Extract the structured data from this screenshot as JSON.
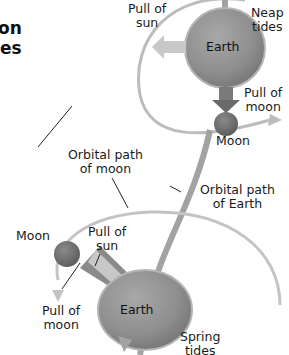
{
  "title": {
    "line1": "on",
    "line2": "es"
  },
  "neap": {
    "heading": "Neap\ntides",
    "pull_of_sun": "Pull of\nsun",
    "earth": "Earth",
    "pull_of_moon": "Pull of\nmoon",
    "moon": "Moon"
  },
  "labels": {
    "orbital_path_moon": "Orbital path\nof moon",
    "orbital_path_earth": "Orbital path\nof Earth"
  },
  "spring": {
    "heading": "Spring\ntides",
    "moon": "Moon",
    "pull_of_sun": "Pull of\nsun",
    "pull_of_moon": "Pull of\nmoon",
    "earth": "Earth"
  },
  "colors": {
    "earth": "#8e8e8e",
    "earth_rim": "#b0b0b0",
    "moon": "#6f6f6f",
    "orbit_moon": "#b9b9b9",
    "orbit_earth": "#a2a2a2",
    "arrow_sun": "#c8c8c8",
    "arrow_moon": "#6a6a6a"
  }
}
